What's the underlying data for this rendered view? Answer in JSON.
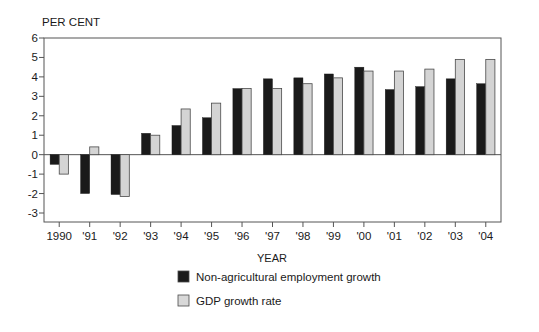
{
  "chart_data": {
    "type": "bar",
    "title": "",
    "unit_label": "PER CENT",
    "xlabel": "YEAR",
    "ylabel": "",
    "categories": [
      "1990",
      "'91",
      "'92",
      "'93",
      "'94",
      "'95",
      "'96",
      "'97",
      "'98",
      "'99",
      "'00",
      "'01",
      "'02",
      "'03",
      "'04"
    ],
    "series": [
      {
        "name": "Non-agricultural employment growth",
        "color": "#1a1a1a",
        "values": [
          -0.5,
          -2.0,
          -2.05,
          1.1,
          1.5,
          1.9,
          3.4,
          3.9,
          3.95,
          4.15,
          4.5,
          3.35,
          3.5,
          3.9,
          3.65
        ]
      },
      {
        "name": "GDP growth rate",
        "color": "#d4d4d4",
        "values": [
          -1.0,
          0.4,
          -2.15,
          1.0,
          2.35,
          2.65,
          3.4,
          3.4,
          3.65,
          3.95,
          4.3,
          4.3,
          4.4,
          4.9,
          4.9
        ]
      }
    ],
    "yticks": [
      6,
      5,
      4,
      3,
      2,
      1,
      0,
      -1,
      -2,
      -3
    ],
    "ytick_labels": [
      "6",
      "5",
      "4",
      "3",
      "2",
      "1",
      "0",
      "-1",
      "-2",
      "-3"
    ],
    "ylim": [
      -3,
      6
    ],
    "grid": false,
    "legend_position": "bottom-center"
  },
  "legend": {
    "items": [
      {
        "label": "Non-agricultural employment growth",
        "swatch": "#1a1a1a"
      },
      {
        "label": "GDP growth rate",
        "swatch": "#d8d8d8"
      }
    ]
  },
  "colors": {
    "series_black": "#1a1a1a",
    "series_gray": "#d8d8d8",
    "axis": "#555555",
    "text": "#1a1a1a",
    "background": "#ffffff"
  }
}
